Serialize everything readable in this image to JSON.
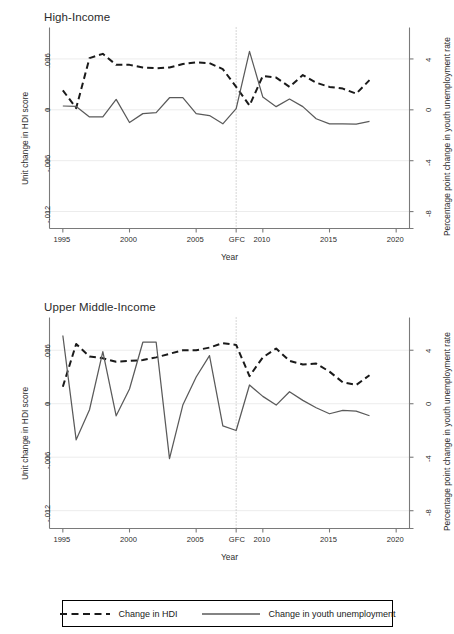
{
  "figure": {
    "panels": [
      {
        "id": "high-income",
        "title": "High-Income",
        "xlabel": "Year",
        "ylabel_left": "Unit change in HDI score",
        "ylabel_right": "Percentage point change in youth unemployment rate",
        "ytick_labels_left": [
          ".006",
          "0",
          "-.006",
          "-.012"
        ],
        "ytick_values_left": [
          0.006,
          0,
          -0.006,
          -0.012
        ],
        "ytick_labels_right": [
          "4",
          "0",
          "-4",
          "-8"
        ],
        "ytick_values_right": [
          4,
          0,
          -4,
          -8
        ],
        "xtick_labels": [
          "1995",
          "2000",
          "2005",
          "GFC",
          "2010",
          "2015",
          "2020"
        ],
        "xtick_values": [
          1995,
          2000,
          2005,
          2008,
          2010,
          2015,
          2020
        ],
        "gfc_year": 2008
      },
      {
        "id": "upper-middle-income",
        "title": "Upper Middle-Income",
        "xlabel": "Year",
        "ylabel_left": "Unit change in HDI score",
        "ylabel_right": "Percentage point change in youth unemployment rate",
        "ytick_labels_left": [
          ".006",
          "0",
          "-.006",
          "-.012"
        ],
        "ytick_values_left": [
          0.006,
          0,
          -0.006,
          -0.012
        ],
        "ytick_labels_right": [
          "4",
          "0",
          "-4",
          "-8"
        ],
        "ytick_values_right": [
          4,
          0,
          -4,
          -8
        ],
        "xtick_labels": [
          "1995",
          "2000",
          "2005",
          "GFC",
          "2010",
          "2015",
          "2020"
        ],
        "xtick_values": [
          1995,
          2000,
          2005,
          2008,
          2010,
          2015,
          2020
        ],
        "gfc_year": 2008
      }
    ]
  },
  "legend": {
    "entries": [
      {
        "label": "Change in HDI",
        "style": "dashed",
        "color": "#1a1a1a"
      },
      {
        "label": "Change in youth unemployment",
        "style": "solid",
        "color": "#5a5a5a"
      }
    ]
  },
  "colors": {
    "hdi_line": "#1a1a1a",
    "unemployment_line": "#5a5a5a",
    "axis": "#7a7a7a",
    "grid": "#ececec",
    "gfc_marker": "#b4b4b4",
    "text": "#2b2b2b",
    "background": "#ffffff"
  },
  "chart_data": [
    {
      "type": "line",
      "panel": "High-Income",
      "title": "High-Income",
      "xlabel": "Year",
      "ylabel": "Unit change in HDI score",
      "ylabel_secondary": "Percentage point change in youth unemployment rate",
      "xlim": [
        1994,
        2021
      ],
      "ylim": [
        -0.014,
        0.009
      ],
      "ylim_secondary": [
        -9.33,
        6.0
      ],
      "grid": true,
      "legend_position": "bottom",
      "annotations": [
        {
          "text": "GFC",
          "x": 2008,
          "type": "vertical-dotted-line"
        }
      ],
      "x": [
        1995,
        1996,
        1997,
        1998,
        1999,
        2000,
        2001,
        2002,
        2003,
        2004,
        2005,
        2006,
        2007,
        2008,
        2009,
        2010,
        2011,
        2012,
        2013,
        2014,
        2015,
        2016,
        2017,
        2018
      ],
      "series": [
        {
          "name": "Change in HDI",
          "style": "dashed",
          "axis": "left",
          "values": [
            0.0023,
            0.0002,
            0.0061,
            0.0066,
            0.0053,
            0.0053,
            0.005,
            0.0049,
            0.005,
            0.0054,
            0.0056,
            0.0055,
            0.0048,
            0.0027,
            0.0005,
            0.004,
            0.0038,
            0.0027,
            0.0041,
            0.0032,
            0.0027,
            0.0025,
            0.0019,
            0.0035
          ]
        },
        {
          "name": "Change in youth unemployment",
          "style": "solid",
          "axis": "right",
          "values": [
            0.3,
            0.27,
            -0.56,
            -0.55,
            0.82,
            -1.0,
            -0.3,
            -0.22,
            0.95,
            0.96,
            -0.3,
            -0.45,
            -1.1,
            0.1,
            4.6,
            1.0,
            0.25,
            0.85,
            0.25,
            -0.7,
            -1.1,
            -1.1,
            -1.12,
            -0.9
          ]
        }
      ]
    },
    {
      "type": "line",
      "panel": "Upper Middle-Income",
      "title": "Upper Middle-Income",
      "xlabel": "Year",
      "ylabel": "Unit change in HDI score",
      "ylabel_secondary": "Percentage point change in youth unemployment rate",
      "xlim": [
        1994,
        2021
      ],
      "ylim": [
        -0.014,
        0.009
      ],
      "ylim_secondary": [
        -9.33,
        6.0
      ],
      "grid": true,
      "legend_position": "bottom",
      "annotations": [
        {
          "text": "GFC",
          "x": 2008,
          "type": "vertical-dotted-line"
        }
      ],
      "x": [
        1995,
        1996,
        1997,
        1998,
        1999,
        2000,
        2001,
        2002,
        2003,
        2004,
        2005,
        2006,
        2007,
        2008,
        2009,
        2010,
        2011,
        2012,
        2013,
        2014,
        2015,
        2016,
        2017,
        2018
      ],
      "series": [
        {
          "name": "Change in HDI",
          "style": "dashed",
          "axis": "left",
          "values": [
            0.0019,
            0.0067,
            0.0053,
            0.0051,
            0.0047,
            0.0048,
            0.0049,
            0.0052,
            0.0056,
            0.006,
            0.006,
            0.0063,
            0.0068,
            0.0066,
            0.0031,
            0.0052,
            0.0062,
            0.0048,
            0.0044,
            0.0045,
            0.0036,
            0.0024,
            0.0021,
            0.0032
          ]
        },
        {
          "name": "Change in youth unemployment",
          "style": "solid",
          "axis": "right",
          "values": [
            5.1,
            -2.7,
            -0.45,
            3.9,
            -0.9,
            1.1,
            4.6,
            4.6,
            -4.1,
            -0.1,
            2.0,
            3.6,
            -1.65,
            -2.0,
            1.4,
            0.55,
            -0.1,
            0.9,
            0.25,
            -0.3,
            -0.75,
            -0.5,
            -0.55,
            -0.9
          ]
        }
      ]
    }
  ]
}
